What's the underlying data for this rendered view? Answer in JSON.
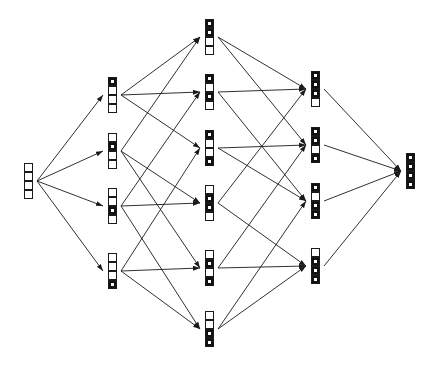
{
  "diagram": {
    "type": "hasse-diagram-boolean-lattice",
    "cells_per_node": 4,
    "colors": {
      "ink": "#1a1a1a",
      "background": "#ffffff",
      "filled": "#111111"
    },
    "columns": [
      {
        "rank": 0,
        "x": 24,
        "nodes": [
          {
            "id": "n0",
            "y": 163,
            "filled": []
          }
        ]
      },
      {
        "rank": 1,
        "x": 108,
        "nodes": [
          {
            "id": "n1",
            "y": 77,
            "filled": [
              1
            ]
          },
          {
            "id": "n2",
            "y": 133,
            "filled": [
              2
            ]
          },
          {
            "id": "n3",
            "y": 188,
            "filled": [
              3
            ]
          },
          {
            "id": "n4",
            "y": 253,
            "filled": [
              4
            ]
          }
        ]
      },
      {
        "rank": 2,
        "x": 205,
        "nodes": [
          {
            "id": "n12",
            "y": 19,
            "filled": [
              1,
              2
            ]
          },
          {
            "id": "n13",
            "y": 74,
            "filled": [
              1,
              3
            ]
          },
          {
            "id": "n14",
            "y": 130,
            "filled": [
              1,
              4
            ]
          },
          {
            "id": "n23",
            "y": 185,
            "filled": [
              2,
              3
            ]
          },
          {
            "id": "n24",
            "y": 250,
            "filled": [
              2,
              4
            ]
          },
          {
            "id": "n34",
            "y": 311,
            "filled": [
              3,
              4
            ]
          }
        ]
      },
      {
        "rank": 3,
        "x": 311,
        "nodes": [
          {
            "id": "n123",
            "y": 71,
            "filled": [
              1,
              2,
              3
            ]
          },
          {
            "id": "n124",
            "y": 127,
            "filled": [
              1,
              2,
              4
            ]
          },
          {
            "id": "n134",
            "y": 183,
            "filled": [
              1,
              3,
              4
            ]
          },
          {
            "id": "n234",
            "y": 248,
            "filled": [
              2,
              3,
              4
            ]
          }
        ]
      },
      {
        "rank": 4,
        "x": 406,
        "nodes": [
          {
            "id": "n1234",
            "y": 153,
            "filled": [
              1,
              2,
              3,
              4
            ]
          }
        ]
      }
    ],
    "edges": [
      [
        "n0",
        "n1"
      ],
      [
        "n0",
        "n2"
      ],
      [
        "n0",
        "n3"
      ],
      [
        "n0",
        "n4"
      ],
      [
        "n1",
        "n12"
      ],
      [
        "n1",
        "n13"
      ],
      [
        "n1",
        "n14"
      ],
      [
        "n2",
        "n12"
      ],
      [
        "n2",
        "n23"
      ],
      [
        "n2",
        "n24"
      ],
      [
        "n3",
        "n13"
      ],
      [
        "n3",
        "n23"
      ],
      [
        "n3",
        "n34"
      ],
      [
        "n4",
        "n14"
      ],
      [
        "n4",
        "n24"
      ],
      [
        "n4",
        "n34"
      ],
      [
        "n12",
        "n123"
      ],
      [
        "n12",
        "n124"
      ],
      [
        "n13",
        "n123"
      ],
      [
        "n13",
        "n134"
      ],
      [
        "n14",
        "n124"
      ],
      [
        "n14",
        "n134"
      ],
      [
        "n23",
        "n123"
      ],
      [
        "n23",
        "n234"
      ],
      [
        "n24",
        "n124"
      ],
      [
        "n24",
        "n234"
      ],
      [
        "n34",
        "n134"
      ],
      [
        "n34",
        "n234"
      ],
      [
        "n123",
        "n1234"
      ],
      [
        "n124",
        "n1234"
      ],
      [
        "n134",
        "n1234"
      ],
      [
        "n234",
        "n1234"
      ]
    ]
  }
}
